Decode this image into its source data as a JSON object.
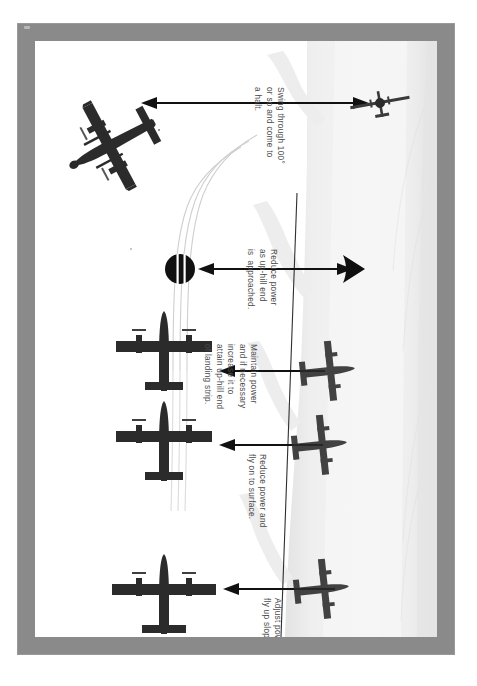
{
  "document": {
    "title": "Sloping strip landing technique diagram",
    "type": "instructional-illustration"
  },
  "frame": {
    "border_color": "#8a8a8a",
    "page_color": "#ffffff"
  },
  "colors": {
    "border_gray": "#8a8a8a",
    "page_white": "#ffffff",
    "terrain_light": "#f1f1f1",
    "terrain_mid": "#e7e7e7",
    "terrain_edge": "#d8d8d8",
    "aircraft_dark": "#2b2b2b",
    "arrow_black": "#111111",
    "text_gray": "#4a4a4a",
    "track_line": "#cfcfcf"
  },
  "captions": [
    {
      "id": "swing",
      "text": "Swing through 100°\nor so and come to\na halt."
    },
    {
      "id": "reduce-uphill",
      "text": "Reduce power\nas up-hill end\nis  approached."
    },
    {
      "id": "maintain",
      "text": "Maintain power\nand if necessary\nincrease it to\nattain up-hill end\nof landing strip."
    },
    {
      "id": "reduce-surface",
      "text": "Reduce power and\nfly on to surface."
    },
    {
      "id": "adjust",
      "text": "Adjust power to\nfly up slope."
    }
  ],
  "steps": [
    {
      "order": 1,
      "label": "Adjust power to fly up slope.",
      "aircraft_view": "planform-top",
      "arrow_direction": "left"
    },
    {
      "order": 2,
      "label": "Reduce power and fly on to surface.",
      "aircraft_view": "planform-top",
      "arrow_direction": "left"
    },
    {
      "order": 3,
      "label": "Maintain power and if necessary increase it to attain up-hill end of landing strip.",
      "aircraft_view": "planform-top",
      "arrow_direction": "left"
    },
    {
      "order": 4,
      "label": "Reduce power as up-hill end is approached.",
      "aircraft_view": "foreshortened-disc",
      "arrow_direction": "left"
    },
    {
      "order": 5,
      "label": "Swing through 100° or so and come to a halt.",
      "aircraft_view": "planform-turned",
      "arrow_direction": "left"
    }
  ],
  "scene": {
    "terrain_name": "sloping landing strip",
    "track_lines": 3,
    "shadow_aircraft_count": 3
  }
}
